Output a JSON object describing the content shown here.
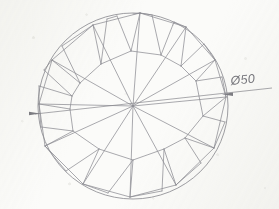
{
  "drawing": {
    "title": "Brilliant-cut gemstone facet plan",
    "background_color": "#fbfbf9",
    "line_color": "#8e8e94",
    "text_color": "#78787e"
  },
  "dimension": {
    "label": "Ø50",
    "symbol": "Ø",
    "value": "50",
    "leader_start_x": 228,
    "leader_end_x": 272,
    "arrow_left_name": "dimension-arrow-left",
    "arrow_right_name": "dimension-arrow-right"
  },
  "geometry": {
    "center_x": 133,
    "center_y": 106,
    "radius_x": 95,
    "radius_y": 93,
    "girdle_name": "girdle-outline",
    "culet_x": 133,
    "culet_y": 106
  },
  "facets": {
    "main_spokes": [
      {
        "name": "main-facet-spoke-1",
        "x": 140,
        "y": 13
      },
      {
        "name": "main-facet-spoke-2",
        "x": 186,
        "y": 27
      },
      {
        "name": "main-facet-spoke-3",
        "x": 215,
        "y": 60
      },
      {
        "name": "main-facet-spoke-4",
        "x": 226,
        "y": 97
      },
      {
        "name": "main-facet-spoke-5",
        "x": 214,
        "y": 148
      },
      {
        "name": "main-facet-spoke-6",
        "x": 176,
        "y": 185
      },
      {
        "name": "main-facet-spoke-7",
        "x": 130,
        "y": 197
      },
      {
        "name": "main-facet-spoke-8",
        "x": 83,
        "y": 184
      },
      {
        "name": "main-facet-spoke-9",
        "x": 45,
        "y": 146
      },
      {
        "name": "main-facet-spoke-10",
        "x": 39,
        "y": 104
      },
      {
        "name": "main-facet-spoke-11",
        "x": 52,
        "y": 60
      },
      {
        "name": "main-facet-spoke-12",
        "x": 93,
        "y": 25
      }
    ],
    "star_facet_count": 12,
    "upper_girdle_facet_count": 24,
    "pattern_type": "pinwheel-radial"
  },
  "annotations": {
    "drawing_note": "Ø50"
  }
}
